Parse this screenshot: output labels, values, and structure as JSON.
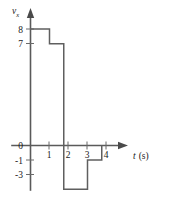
{
  "figure": {
    "name": "velocity-time-step-graph",
    "background_color": "#ffffff",
    "line_color": "#5f5f5f",
    "axis_color": "#5a5a5a",
    "text_color": "#1a1a1a"
  },
  "axes": {
    "y_axis": {
      "label_symbol": "v",
      "label_subscript": "x",
      "tick_labels": [
        "8",
        "7",
        "0",
        "-1",
        "-3"
      ]
    },
    "x_axis": {
      "label_symbol": "t",
      "label_unit": "(s)",
      "tick_labels": [
        "1",
        "2",
        "3",
        "4"
      ]
    }
  },
  "chart_data": {
    "type": "line",
    "title": "",
    "xlabel": "t (s)",
    "ylabel": "v_x",
    "xlim": [
      0,
      4.6
    ],
    "ylim": [
      -3.8,
      8.8
    ],
    "grid": false,
    "legend": false,
    "step_style": "post",
    "x_ticks": [
      1,
      2,
      3,
      4
    ],
    "y_ticks": [
      8,
      7,
      0,
      -1,
      -3
    ],
    "y_tick_labels": [
      "8",
      "7",
      "0",
      "-1",
      "-3"
    ],
    "segments": [
      {
        "x_start": 0.0,
        "x_end": 1.0,
        "value": 8
      },
      {
        "x_start": 1.0,
        "x_end": 1.75,
        "value": 7
      },
      {
        "x_start": 1.75,
        "x_end": 3.0,
        "value": -3
      },
      {
        "x_start": 3.0,
        "x_end": 3.75,
        "value": -1
      },
      {
        "x_start": 3.75,
        "x_end": 3.75,
        "value": 0
      }
    ],
    "x": [
      0,
      1,
      1,
      1.75,
      1.75,
      3,
      3,
      3.75,
      3.75
    ],
    "y": [
      8,
      8,
      7,
      7,
      -3,
      -3,
      -1,
      -1,
      0
    ]
  }
}
